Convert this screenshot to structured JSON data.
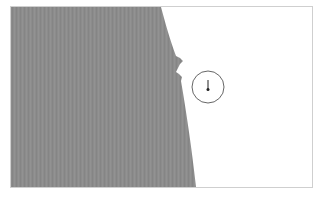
{
  "map": {
    "frame": {
      "x": 10,
      "y": 6,
      "width": 303,
      "height": 182
    },
    "colors": {
      "land": "#8c8c8c",
      "water": "#ffffff",
      "border": "#cfcfcf",
      "marker_stroke": "#666666",
      "pin": "#222222"
    },
    "marker": {
      "type": "circle-with-pin",
      "cx": 208,
      "cy": 87,
      "r": 16
    }
  }
}
